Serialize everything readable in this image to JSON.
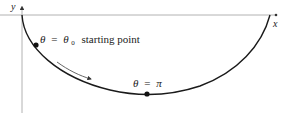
{
  "diagram": {
    "type": "cycloid-like curve with axes",
    "axes": {
      "x_label": "x",
      "y_label": "y"
    },
    "labels": {
      "start_theta": "θ",
      "start_eq": "=",
      "start_theta0": "θ",
      "start_sub": "0",
      "start_text": "starting point",
      "bottom_theta": "θ",
      "bottom_eq": "=",
      "bottom_pi": "π"
    },
    "points": [
      {
        "name": "starting-point",
        "label": "θ = θ0 starting point"
      },
      {
        "name": "bottom-point",
        "label": "θ = π"
      }
    ],
    "colors": {
      "curve": "#1a1a1a",
      "axis": "#9a9a9a",
      "arrow": "#555555",
      "text": "#222222"
    }
  }
}
